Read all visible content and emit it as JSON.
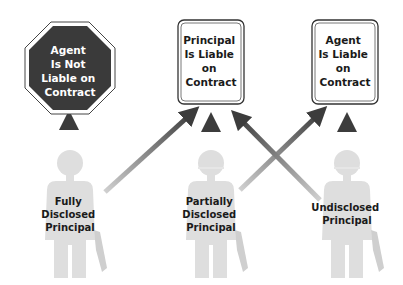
{
  "diagram": {
    "colors": {
      "octagon_fill": "#3a3a3a",
      "octagon_text": "#ffffff",
      "sign_border": "#333333",
      "sign_fill": "#ffffff",
      "sign_text": "#1a1a1a",
      "person_fill": "#dedede",
      "arrow_dark": "#3c3c3c",
      "arrow_light": "#bdbdbd"
    },
    "outcomes": [
      {
        "id": "agent-not-liable",
        "shape": "octagon",
        "lines": [
          "Agent",
          "Is Not",
          "Liable on",
          "Contract"
        ]
      },
      {
        "id": "principal-liable",
        "shape": "rounded-rect",
        "lines": [
          "Principal",
          "Is Liable",
          "on",
          "Contract"
        ]
      },
      {
        "id": "agent-liable",
        "shape": "rounded-rect",
        "lines": [
          "Agent",
          "Is Liable",
          "on",
          "Contract"
        ]
      }
    ],
    "principals": [
      {
        "id": "fully-disclosed",
        "lines": [
          "Fully",
          "Disclosed",
          "Principal"
        ],
        "points_to": [
          "agent-not-liable",
          "principal-liable"
        ]
      },
      {
        "id": "partially-disclosed",
        "lines": [
          "Partially",
          "Disclosed",
          "Principal"
        ],
        "points_to": [
          "principal-liable",
          "agent-liable"
        ]
      },
      {
        "id": "undisclosed",
        "lines": [
          "Undisclosed",
          "Principal"
        ],
        "points_to": [
          "agent-liable",
          "principal-liable"
        ]
      }
    ]
  }
}
